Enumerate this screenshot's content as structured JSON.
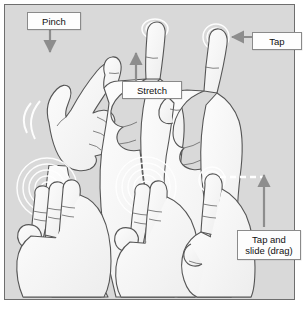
{
  "figure": {
    "name": "touch-gesture-illustration",
    "background_color": "#d9d9d9",
    "frame_border_color": "#6e6e6e",
    "page_background": "#ffffff",
    "hand_fill": "#f7f7f7",
    "hand_outline": "#555555",
    "ripple_color": "#ffffff",
    "arrow_color": "#8d8d8d"
  },
  "callouts": [
    {
      "id": "pinch",
      "label": "Pinch",
      "arrow": "down",
      "target": "index-fingertip-left-hand"
    },
    {
      "id": "tap",
      "label": "Tap",
      "arrow": "left",
      "target": "index-fingertip-right-hand"
    },
    {
      "id": "stretch",
      "label": "Stretch",
      "arrow": "up",
      "target": "thumb-and-index-gap"
    },
    {
      "id": "drag",
      "label": "Tap and slide (drag)",
      "label_line1": "Tap and",
      "label_line2": "slide (drag)",
      "arrow": "up",
      "target": "fingertip-slide-path"
    }
  ],
  "gestures": [
    {
      "row": 1,
      "col": 1,
      "name": "pinch-hand",
      "fingers": 2,
      "ripples": 1,
      "motion": "pinch-in"
    },
    {
      "row": 1,
      "col": 2,
      "name": "stretch-hand",
      "fingers": 2,
      "ripples": 2,
      "motion": "stretch-out"
    },
    {
      "row": 1,
      "col": 3,
      "name": "tap-hand",
      "fingers": 1,
      "ripples": 3,
      "motion": "tap"
    },
    {
      "row": 2,
      "col": 1,
      "name": "three-finger-tap-hand",
      "fingers": 3,
      "ripples": 5,
      "motion": "tap"
    },
    {
      "row": 2,
      "col": 2,
      "name": "two-finger-tap-hand",
      "fingers": 2,
      "ripples": 5,
      "motion": "tap"
    },
    {
      "row": 2,
      "col": 3,
      "name": "tap-and-slide-hand",
      "fingers": 1,
      "ripples": 3,
      "motion": "slide-up"
    }
  ]
}
